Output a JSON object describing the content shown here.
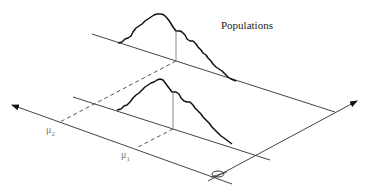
{
  "diagram": {
    "title": "Populations",
    "labels": {
      "mu2_base": "μ",
      "mu2_sub": "2",
      "mu1_base": "μ",
      "mu1_sub": "1"
    },
    "colors": {
      "curve": "#111111",
      "axis": "#444444",
      "dashed": "#555555",
      "mean_line": "#888888"
    },
    "elements": [
      "population-1-distribution-curve",
      "population-2-distribution-curve",
      "population-baselines",
      "mean-projection-dashed-lines",
      "mean-axis-arrow",
      "population-axis-arrow",
      "origin-ellipse"
    ]
  }
}
